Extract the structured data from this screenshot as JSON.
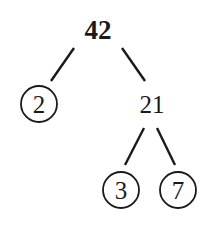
{
  "diagram": {
    "type": "factor-tree",
    "root": {
      "value": "42"
    },
    "level1": [
      {
        "value": "2",
        "prime": true
      },
      {
        "value": "21",
        "prime": false
      }
    ],
    "level2": [
      {
        "value": "3",
        "prime": true
      },
      {
        "value": "7",
        "prime": true
      }
    ],
    "colors": {
      "ink": "#1a1a1a",
      "background": "#ffffff"
    }
  }
}
